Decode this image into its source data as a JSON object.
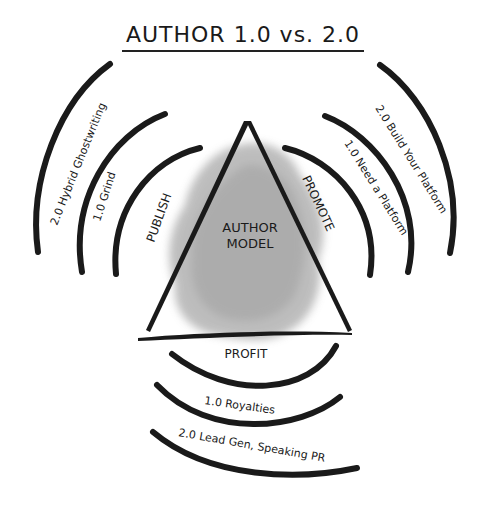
{
  "title": "AUTHOR 1.0 vs. 2.0",
  "center": {
    "line1": "AUTHOR",
    "line2": "MODEL"
  },
  "sides": {
    "left": {
      "label": "PUBLISH",
      "arc_1_0": "1.0 Grind",
      "arc_2_0": "2.0 Hybrid Ghostwriting"
    },
    "right": {
      "label": "PROMOTE",
      "arc_1_0": "1.0 Need a Platform",
      "arc_2_0": "2.0 Build Your Platform"
    },
    "bottom": {
      "label": "PROFIT",
      "arc_1_0": "1.0 Royalties",
      "arc_2_0": "2.0 Lead Gen, Speaking PR"
    }
  },
  "colors": {
    "ink": "#1a1a1a",
    "watercolor": "#9a9a9a",
    "background": "#ffffff"
  }
}
